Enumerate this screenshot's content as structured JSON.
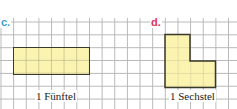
{
  "exercises": [
    {
      "label": "c.",
      "label_color": "#3a9fd6",
      "shape": "rectangle",
      "caption": "1 Fünftel"
    },
    {
      "label": "d.",
      "label_color": "#e0325a",
      "shape": "L-shape",
      "caption": "1 Sechstel"
    }
  ],
  "colors": {
    "fill": "#fbf3b0",
    "outline": "#3a3a2a",
    "grid": "#b8b8b8"
  }
}
